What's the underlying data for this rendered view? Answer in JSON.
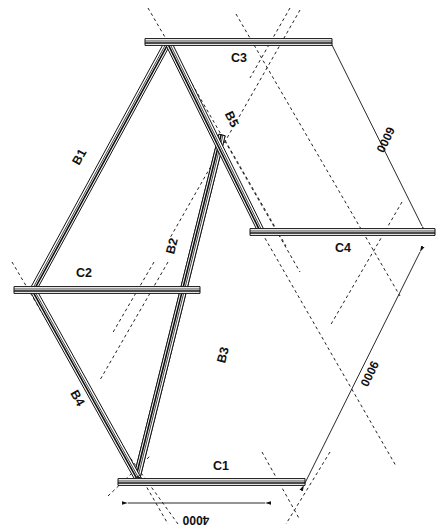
{
  "drawing": {
    "title": "Rhombic braced frame elevation",
    "background_color": "#ffffff",
    "line_color": "#111111",
    "members": {
      "beams": [
        {
          "id": "b1",
          "label": "B1",
          "x1": 33,
          "y1": 290,
          "x2": 168,
          "y2": 42,
          "label_x": 83,
          "label_y": 159,
          "label_rot": -61
        },
        {
          "id": "b2",
          "label": "B2",
          "x1": 137,
          "y1": 477,
          "x2": 222,
          "y2": 135,
          "label_x": 176,
          "label_y": 247,
          "label_rot": -76
        },
        {
          "id": "b3",
          "label": "B3",
          "x1": 222,
          "y1": 135,
          "x2": 137,
          "y2": 477,
          "label_x": 227,
          "label_y": 356,
          "label_rot": -76
        },
        {
          "id": "b4",
          "label": "B4",
          "x1": 33,
          "y1": 290,
          "x2": 137,
          "y2": 477,
          "label_x": 74,
          "label_y": 400,
          "label_rot": 61
        },
        {
          "id": "b5",
          "label": "B5",
          "x1": 168,
          "y1": 42,
          "x2": 262,
          "y2": 233,
          "label_x": 228,
          "label_y": 121,
          "label_rot": 64
        }
      ],
      "columns": [
        {
          "id": "c1",
          "label": "C1",
          "x1": 118,
          "y1": 482,
          "x2": 305,
          "y2": 482,
          "label_x": 221,
          "label_y": 470
        },
        {
          "id": "c2",
          "label": "C2",
          "x1": 14,
          "y1": 290,
          "x2": 200,
          "y2": 290,
          "label_x": 84,
          "label_y": 277
        },
        {
          "id": "c3",
          "label": "C3",
          "x1": 145,
          "y1": 42,
          "x2": 332,
          "y2": 42,
          "label_x": 239,
          "label_y": 62
        },
        {
          "id": "c4",
          "label": "C4",
          "x1": 250,
          "y1": 232,
          "x2": 435,
          "y2": 232,
          "label_x": 343,
          "label_y": 252
        }
      ]
    },
    "dimensions": [
      {
        "id": "dim-4000",
        "value": "4000",
        "x1": 128,
        "y1": 503,
        "x2": 265,
        "y2": 503,
        "label_x": 196,
        "label_y": 516,
        "label_rot": 180
      },
      {
        "id": "dim-6000",
        "value": "6000",
        "x1": 332,
        "y1": 45,
        "x2": 422,
        "y2": 226,
        "label_x": 382,
        "label_y": 138,
        "label_rot": 116
      },
      {
        "id": "dim-9000",
        "value": "9000",
        "x1": 420,
        "y1": 252,
        "x2": 304,
        "y2": 485,
        "label_x": 366,
        "label_y": 372,
        "label_rot": 116
      }
    ],
    "construction_lines": [
      {
        "id": "cl-1",
        "x1": 148,
        "y1": 8,
        "x2": 190,
        "y2": 80
      },
      {
        "id": "cl-2",
        "x1": 290,
        "y1": 8,
        "x2": 250,
        "y2": 78
      },
      {
        "id": "cl-3",
        "x1": 168,
        "y1": 42,
        "x2": 300,
        "y2": 272
      },
      {
        "id": "cl-4",
        "x1": 300,
        "y1": 10,
        "x2": 170,
        "y2": 238
      },
      {
        "id": "cl-5",
        "x1": 12,
        "y1": 262,
        "x2": 54,
        "y2": 333
      },
      {
        "id": "cl-6",
        "x1": 154,
        "y1": 262,
        "x2": 112,
        "y2": 334
      },
      {
        "id": "cl-7",
        "x1": 33,
        "y1": 290,
        "x2": 168,
        "y2": 524
      },
      {
        "id": "cl-8",
        "x1": 168,
        "y1": 262,
        "x2": 100,
        "y2": 380
      },
      {
        "id": "cl-9",
        "x1": 108,
        "y1": 496,
        "x2": 150,
        "y2": 456
      },
      {
        "id": "cl-10",
        "x1": 178,
        "y1": 524,
        "x2": 126,
        "y2": 452
      },
      {
        "id": "cl-11",
        "x1": 262,
        "y1": 452,
        "x2": 300,
        "y2": 520
      },
      {
        "id": "cl-12",
        "x1": 330,
        "y1": 452,
        "x2": 286,
        "y2": 524
      },
      {
        "id": "cl-13",
        "x1": 262,
        "y1": 233,
        "x2": 396,
        "y2": 466
      },
      {
        "id": "cl-14",
        "x1": 402,
        "y1": 202,
        "x2": 330,
        "y2": 326
      },
      {
        "id": "cl-15",
        "x1": 236,
        "y1": 14,
        "x2": 400,
        "y2": 296
      },
      {
        "id": "cl-16",
        "x1": 222,
        "y1": 135,
        "x2": 286,
        "y2": 246
      }
    ]
  }
}
